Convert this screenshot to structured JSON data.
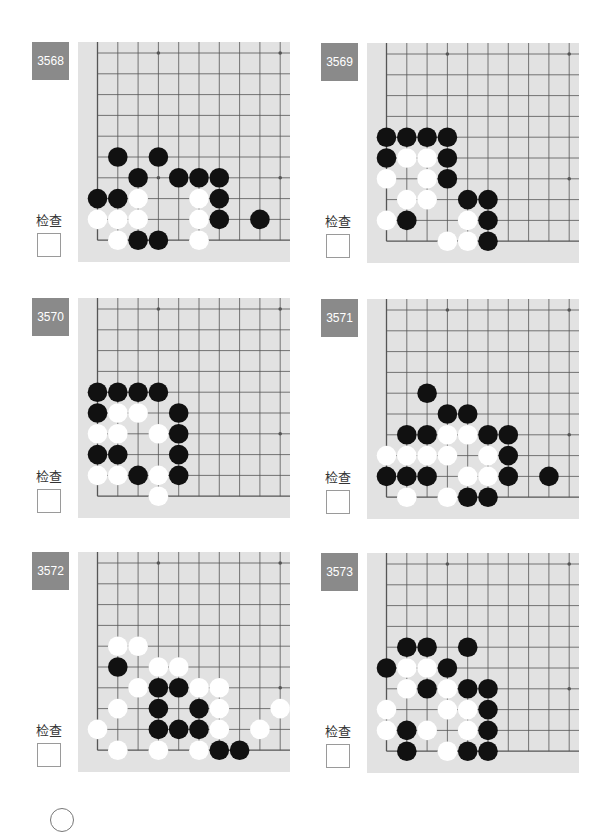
{
  "check_label": "检查",
  "colors": {
    "label_bg": "#8a8a8a",
    "board_bg": "#e2e2e2",
    "grid": "#555555",
    "black": "#111111",
    "white": "#ffffff"
  },
  "problems": [
    {
      "number": "3568",
      "check_label": "检查",
      "checked": false,
      "stones": [
        {
          "c": "B",
          "x": 1,
          "y": 5
        },
        {
          "c": "B",
          "x": 3,
          "y": 5
        },
        {
          "c": "B",
          "x": 2,
          "y": 6
        },
        {
          "c": "B",
          "x": 4,
          "y": 6
        },
        {
          "c": "B",
          "x": 5,
          "y": 6
        },
        {
          "c": "B",
          "x": 6,
          "y": 6
        },
        {
          "c": "B",
          "x": 0,
          "y": 7
        },
        {
          "c": "B",
          "x": 1,
          "y": 7
        },
        {
          "c": "W",
          "x": 2,
          "y": 7
        },
        {
          "c": "W",
          "x": 5,
          "y": 7
        },
        {
          "c": "B",
          "x": 6,
          "y": 7
        },
        {
          "c": "W",
          "x": 0,
          "y": 8
        },
        {
          "c": "W",
          "x": 1,
          "y": 8
        },
        {
          "c": "W",
          "x": 2,
          "y": 8
        },
        {
          "c": "W",
          "x": 5,
          "y": 8
        },
        {
          "c": "B",
          "x": 6,
          "y": 8
        },
        {
          "c": "B",
          "x": 8,
          "y": 8
        },
        {
          "c": "W",
          "x": 1,
          "y": 9
        },
        {
          "c": "B",
          "x": 2,
          "y": 9
        },
        {
          "c": "B",
          "x": 3,
          "y": 9
        },
        {
          "c": "W",
          "x": 5,
          "y": 9
        }
      ]
    },
    {
      "number": "3569",
      "check_label": "检查",
      "checked": false,
      "stones": [
        {
          "c": "B",
          "x": 0,
          "y": 4
        },
        {
          "c": "B",
          "x": 1,
          "y": 4
        },
        {
          "c": "B",
          "x": 2,
          "y": 4
        },
        {
          "c": "B",
          "x": 3,
          "y": 4
        },
        {
          "c": "B",
          "x": 0,
          "y": 5
        },
        {
          "c": "W",
          "x": 1,
          "y": 5
        },
        {
          "c": "W",
          "x": 2,
          "y": 5
        },
        {
          "c": "B",
          "x": 3,
          "y": 5
        },
        {
          "c": "W",
          "x": 0,
          "y": 6
        },
        {
          "c": "W",
          "x": 2,
          "y": 6
        },
        {
          "c": "B",
          "x": 3,
          "y": 6
        },
        {
          "c": "W",
          "x": 1,
          "y": 7
        },
        {
          "c": "W",
          "x": 2,
          "y": 7
        },
        {
          "c": "B",
          "x": 4,
          "y": 7
        },
        {
          "c": "B",
          "x": 5,
          "y": 7
        },
        {
          "c": "W",
          "x": 0,
          "y": 8
        },
        {
          "c": "B",
          "x": 1,
          "y": 8
        },
        {
          "c": "W",
          "x": 4,
          "y": 8
        },
        {
          "c": "B",
          "x": 5,
          "y": 8
        },
        {
          "c": "W",
          "x": 3,
          "y": 9
        },
        {
          "c": "W",
          "x": 4,
          "y": 9
        },
        {
          "c": "B",
          "x": 5,
          "y": 9
        }
      ]
    },
    {
      "number": "3570",
      "check_label": "检查",
      "checked": false,
      "stones": [
        {
          "c": "B",
          "x": 0,
          "y": 4
        },
        {
          "c": "B",
          "x": 1,
          "y": 4
        },
        {
          "c": "B",
          "x": 2,
          "y": 4
        },
        {
          "c": "B",
          "x": 3,
          "y": 4
        },
        {
          "c": "B",
          "x": 0,
          "y": 5
        },
        {
          "c": "W",
          "x": 1,
          "y": 5
        },
        {
          "c": "W",
          "x": 2,
          "y": 5
        },
        {
          "c": "B",
          "x": 4,
          "y": 5
        },
        {
          "c": "W",
          "x": 0,
          "y": 6
        },
        {
          "c": "W",
          "x": 1,
          "y": 6
        },
        {
          "c": "W",
          "x": 3,
          "y": 6
        },
        {
          "c": "B",
          "x": 4,
          "y": 6
        },
        {
          "c": "B",
          "x": 0,
          "y": 7
        },
        {
          "c": "B",
          "x": 1,
          "y": 7
        },
        {
          "c": "B",
          "x": 4,
          "y": 7
        },
        {
          "c": "W",
          "x": 0,
          "y": 8
        },
        {
          "c": "W",
          "x": 1,
          "y": 8
        },
        {
          "c": "B",
          "x": 2,
          "y": 8
        },
        {
          "c": "W",
          "x": 3,
          "y": 8
        },
        {
          "c": "B",
          "x": 4,
          "y": 8
        },
        {
          "c": "W",
          "x": 3,
          "y": 9
        }
      ]
    },
    {
      "number": "3571",
      "check_label": "检查",
      "checked": false,
      "stones": [
        {
          "c": "B",
          "x": 2,
          "y": 4
        },
        {
          "c": "B",
          "x": 3,
          "y": 5
        },
        {
          "c": "B",
          "x": 4,
          "y": 5
        },
        {
          "c": "B",
          "x": 1,
          "y": 6
        },
        {
          "c": "B",
          "x": 2,
          "y": 6
        },
        {
          "c": "W",
          "x": 3,
          "y": 6
        },
        {
          "c": "W",
          "x": 4,
          "y": 6
        },
        {
          "c": "B",
          "x": 5,
          "y": 6
        },
        {
          "c": "B",
          "x": 6,
          "y": 6
        },
        {
          "c": "W",
          "x": 0,
          "y": 7
        },
        {
          "c": "W",
          "x": 1,
          "y": 7
        },
        {
          "c": "W",
          "x": 2,
          "y": 7
        },
        {
          "c": "W",
          "x": 3,
          "y": 7
        },
        {
          "c": "W",
          "x": 5,
          "y": 7
        },
        {
          "c": "B",
          "x": 6,
          "y": 7
        },
        {
          "c": "B",
          "x": 0,
          "y": 8
        },
        {
          "c": "B",
          "x": 1,
          "y": 8
        },
        {
          "c": "B",
          "x": 2,
          "y": 8
        },
        {
          "c": "W",
          "x": 4,
          "y": 8
        },
        {
          "c": "W",
          "x": 5,
          "y": 8
        },
        {
          "c": "B",
          "x": 6,
          "y": 8
        },
        {
          "c": "B",
          "x": 8,
          "y": 8
        },
        {
          "c": "W",
          "x": 1,
          "y": 9
        },
        {
          "c": "W",
          "x": 3,
          "y": 9
        },
        {
          "c": "B",
          "x": 4,
          "y": 9
        },
        {
          "c": "B",
          "x": 5,
          "y": 9
        }
      ]
    },
    {
      "number": "3572",
      "check_label": "检查",
      "checked": false,
      "stones": [
        {
          "c": "W",
          "x": 1,
          "y": 4
        },
        {
          "c": "W",
          "x": 2,
          "y": 4
        },
        {
          "c": "B",
          "x": 1,
          "y": 5
        },
        {
          "c": "W",
          "x": 3,
          "y": 5
        },
        {
          "c": "W",
          "x": 4,
          "y": 5
        },
        {
          "c": "W",
          "x": 2,
          "y": 6
        },
        {
          "c": "B",
          "x": 3,
          "y": 6
        },
        {
          "c": "B",
          "x": 4,
          "y": 6
        },
        {
          "c": "W",
          "x": 5,
          "y": 6
        },
        {
          "c": "W",
          "x": 6,
          "y": 6
        },
        {
          "c": "W",
          "x": 1,
          "y": 7
        },
        {
          "c": "B",
          "x": 3,
          "y": 7
        },
        {
          "c": "B",
          "x": 5,
          "y": 7
        },
        {
          "c": "W",
          "x": 6,
          "y": 7
        },
        {
          "c": "W",
          "x": 9,
          "y": 7
        },
        {
          "c": "W",
          "x": 0,
          "y": 8
        },
        {
          "c": "B",
          "x": 3,
          "y": 8
        },
        {
          "c": "B",
          "x": 4,
          "y": 8
        },
        {
          "c": "B",
          "x": 5,
          "y": 8
        },
        {
          "c": "W",
          "x": 6,
          "y": 8
        },
        {
          "c": "W",
          "x": 8,
          "y": 8
        },
        {
          "c": "W",
          "x": 1,
          "y": 9
        },
        {
          "c": "W",
          "x": 3,
          "y": 9
        },
        {
          "c": "W",
          "x": 5,
          "y": 9
        },
        {
          "c": "B",
          "x": 6,
          "y": 9
        },
        {
          "c": "B",
          "x": 7,
          "y": 9
        }
      ]
    },
    {
      "number": "3573",
      "check_label": "检查",
      "checked": false,
      "stones": [
        {
          "c": "B",
          "x": 1,
          "y": 4
        },
        {
          "c": "B",
          "x": 2,
          "y": 4
        },
        {
          "c": "B",
          "x": 4,
          "y": 4
        },
        {
          "c": "B",
          "x": 0,
          "y": 5
        },
        {
          "c": "W",
          "x": 1,
          "y": 5
        },
        {
          "c": "W",
          "x": 2,
          "y": 5
        },
        {
          "c": "B",
          "x": 3,
          "y": 5
        },
        {
          "c": "W",
          "x": 1,
          "y": 6
        },
        {
          "c": "B",
          "x": 2,
          "y": 6
        },
        {
          "c": "W",
          "x": 3,
          "y": 6
        },
        {
          "c": "B",
          "x": 4,
          "y": 6
        },
        {
          "c": "B",
          "x": 5,
          "y": 6
        },
        {
          "c": "W",
          "x": 0,
          "y": 7
        },
        {
          "c": "W",
          "x": 3,
          "y": 7
        },
        {
          "c": "W",
          "x": 4,
          "y": 7
        },
        {
          "c": "B",
          "x": 5,
          "y": 7
        },
        {
          "c": "W",
          "x": 0,
          "y": 8
        },
        {
          "c": "B",
          "x": 1,
          "y": 8
        },
        {
          "c": "W",
          "x": 2,
          "y": 8
        },
        {
          "c": "W",
          "x": 4,
          "y": 8
        },
        {
          "c": "B",
          "x": 5,
          "y": 8
        },
        {
          "c": "B",
          "x": 1,
          "y": 9
        },
        {
          "c": "W",
          "x": 3,
          "y": 9
        },
        {
          "c": "B",
          "x": 4,
          "y": 9
        },
        {
          "c": "B",
          "x": 5,
          "y": 9
        }
      ]
    }
  ],
  "board": {
    "columns": 10,
    "rows": 10,
    "star_points": [
      {
        "x": 3,
        "y": 0
      },
      {
        "x": 9,
        "y": 0
      },
      {
        "x": 3,
        "y": 6
      },
      {
        "x": 9,
        "y": 6
      }
    ]
  }
}
